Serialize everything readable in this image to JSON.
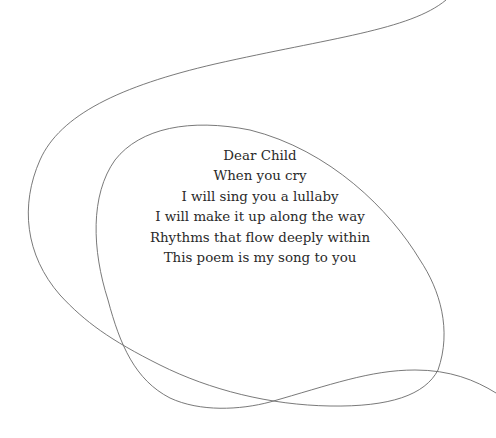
{
  "poem": {
    "lines": [
      "Dear Child",
      "When you cry",
      "I will sing you a lullaby",
      "I will make it up along the way",
      "Rhythms that flow deeply within",
      "This poem is my song to you"
    ]
  },
  "decoration": {
    "stroke_color": "#6a6a6a",
    "background": "#ffffff"
  }
}
